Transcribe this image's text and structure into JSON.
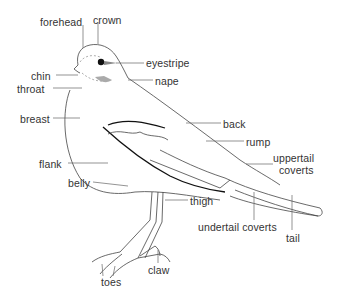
{
  "diagram": {
    "labels": [
      {
        "id": "forehead",
        "text": "forehead",
        "x": 40,
        "y": 17
      },
      {
        "id": "crown",
        "text": "crown",
        "x": 93,
        "y": 15
      },
      {
        "id": "eyestripe",
        "text": "eyestripe",
        "x": 146,
        "y": 58
      },
      {
        "id": "nape",
        "text": "nape",
        "x": 155,
        "y": 76
      },
      {
        "id": "chin",
        "text": "chin",
        "x": 31,
        "y": 71
      },
      {
        "id": "throat",
        "text": "throat",
        "x": 17,
        "y": 84
      },
      {
        "id": "breast",
        "text": "breast",
        "x": 20,
        "y": 114
      },
      {
        "id": "back",
        "text": "back",
        "x": 223,
        "y": 119
      },
      {
        "id": "rump",
        "text": "rump",
        "x": 246,
        "y": 137
      },
      {
        "id": "uppertail-coverts-1",
        "text": "uppertail",
        "x": 273,
        "y": 153
      },
      {
        "id": "uppertail-coverts-2",
        "text": "coverts",
        "x": 279,
        "y": 165
      },
      {
        "id": "flank",
        "text": "flank",
        "x": 39,
        "y": 159
      },
      {
        "id": "belly",
        "text": "belly",
        "x": 68,
        "y": 178
      },
      {
        "id": "thigh",
        "text": "thigh",
        "x": 190,
        "y": 196
      },
      {
        "id": "undertail-coverts",
        "text": "undertail coverts",
        "x": 198,
        "y": 222
      },
      {
        "id": "tail",
        "text": "tail",
        "x": 286,
        "y": 233
      },
      {
        "id": "claw",
        "text": "claw",
        "x": 148,
        "y": 265
      },
      {
        "id": "toes",
        "text": "toes",
        "x": 101,
        "y": 277
      }
    ]
  }
}
